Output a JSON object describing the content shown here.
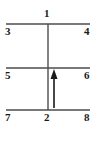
{
  "figure": {
    "type": "line-diagram",
    "background_color": "#ffffff",
    "stroke_color": "#4d4d4d",
    "label_color": "#1a1a1a",
    "canvas": {
      "width": 97,
      "height": 142
    },
    "horizontal_lines": [
      {
        "name": "top-rail",
        "y": 24,
        "x1": 6,
        "x2": 90
      },
      {
        "name": "middle-rail",
        "y": 68,
        "x1": 6,
        "x2": 90
      },
      {
        "name": "bottom-rail",
        "y": 110,
        "x1": 6,
        "x2": 90
      }
    ],
    "vertical_lines": [
      {
        "name": "center-stem",
        "x": 48,
        "y1": 24,
        "y2": 110
      }
    ],
    "arrow": {
      "name": "upward-arrow",
      "x": 54,
      "tail_y": 108,
      "head_y": 69,
      "direction": "up",
      "head_width": 7,
      "head_height": 9
    },
    "labels": [
      {
        "id": "1",
        "text": "1",
        "position": "top-center",
        "x": 44,
        "y": 8
      },
      {
        "id": "3",
        "text": "3",
        "position": "top-left",
        "x": 5,
        "y": 26
      },
      {
        "id": "4",
        "text": "4",
        "position": "top-right",
        "x": 84,
        "y": 26
      },
      {
        "id": "5",
        "text": "5",
        "position": "middle-left",
        "x": 5,
        "y": 70
      },
      {
        "id": "6",
        "text": "6",
        "position": "middle-right",
        "x": 84,
        "y": 70
      },
      {
        "id": "7",
        "text": "7",
        "position": "bottom-left",
        "x": 5,
        "y": 112
      },
      {
        "id": "2",
        "text": "2",
        "position": "bottom-center",
        "x": 44,
        "y": 112
      },
      {
        "id": "8",
        "text": "8",
        "position": "bottom-right",
        "x": 84,
        "y": 112
      }
    ]
  }
}
